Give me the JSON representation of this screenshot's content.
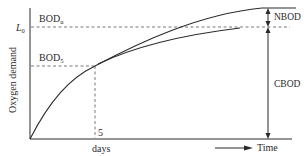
{
  "diagram": {
    "y_axis_label": "Oxygen demand",
    "x_axis_label": "days",
    "x_tick_label": "5",
    "time_label": "Time",
    "labels": {
      "bod_u_main": "BOD",
      "bod_u_sub": "u",
      "l0_main": "L",
      "l0_sub": "0",
      "bod5_main": "BOD",
      "bod5_sub": "5",
      "nbod": "NBOD",
      "cbod": "CBOD"
    },
    "colors": {
      "line": "#2a2a2a",
      "background": "#ffffff"
    }
  }
}
